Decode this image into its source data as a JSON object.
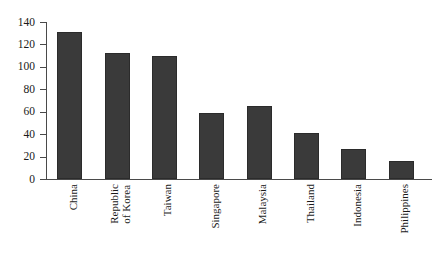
{
  "chart_data": {
    "type": "bar",
    "title": "",
    "subtitle": "",
    "xlabel": "",
    "ylabel": "",
    "ylim": [
      0,
      140
    ],
    "ytick_step": 20,
    "grid": false,
    "legend": null,
    "bar_color": "#3a3a3a",
    "axis_color": "#4a4a4a",
    "categories": [
      "China",
      "Republic of Korea",
      "Taiwan",
      "Singapore",
      "Malaysia",
      "Thailand",
      "Indonesia",
      "Philippines"
    ],
    "category_lines": [
      [
        "China"
      ],
      [
        "Republic",
        "of Korea"
      ],
      [
        "Taiwan"
      ],
      [
        "Singapore"
      ],
      [
        "Malaysia"
      ],
      [
        "Thailand"
      ],
      [
        "Indonesia"
      ],
      [
        "Philippines"
      ]
    ],
    "values": [
      131,
      112,
      110,
      59,
      65,
      41,
      27,
      16
    ],
    "ytick_labels": [
      "140",
      "120",
      "100",
      "80",
      "60",
      "40",
      "20",
      "0"
    ],
    "ytick_values": [
      140,
      120,
      100,
      80,
      60,
      40,
      20,
      0
    ]
  }
}
